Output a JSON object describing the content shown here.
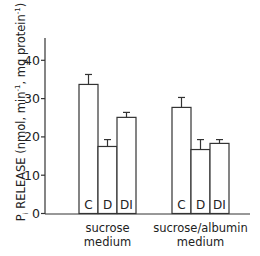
{
  "chart_data": {
    "type": "bar",
    "title": "",
    "ylabel": "Pi RELEASE (nmol, min-1, mg protein-1)",
    "ylabel_parts": {
      "main": "P",
      "sub": "i",
      "rest": " RELEASE (nmol, min",
      "sup1": "-1",
      "mid": ", mg protein",
      "sup2": "-1",
      "end": ")"
    },
    "xlabel": "",
    "ylim": [
      0,
      45
    ],
    "yticks": [
      0,
      10,
      20,
      30,
      40
    ],
    "grid": false,
    "legend": "none",
    "groups": [
      {
        "label_line1": "sucrose",
        "label_line2": "medium"
      },
      {
        "label_line1": "sucrose/albumin",
        "label_line2": "medium"
      }
    ],
    "categories": [
      "C",
      "D",
      "DI"
    ],
    "series": [
      {
        "name": "sucrose medium",
        "values": [
          33.7,
          17.5,
          25.1
        ],
        "error": [
          2.6,
          1.8,
          1.3
        ]
      },
      {
        "name": "sucrose/albumin medium",
        "values": [
          27.7,
          16.7,
          18.3
        ],
        "error": [
          2.6,
          2.6,
          1.0
        ]
      }
    ]
  }
}
